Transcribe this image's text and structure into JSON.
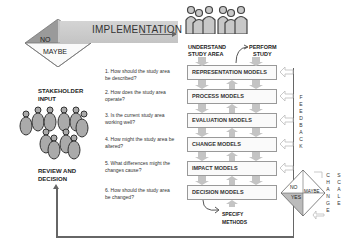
{
  "decision_diamond_left": {
    "no": "NO",
    "yes": "YES",
    "maybe": "MAYBE"
  },
  "implementation": {
    "label": "IMPLEMENTATION"
  },
  "stakeholder": {
    "label_line1": "STAKEHOLDER",
    "label_line2": "INPUT"
  },
  "review": {
    "label_line1": "REVIEW AND",
    "label_line2": "DECISION"
  },
  "questions": [
    {
      "num": "1.",
      "text": "How should the study area be described?"
    },
    {
      "num": "2.",
      "text": "How does the study area operate?"
    },
    {
      "num": "3.",
      "text": "Is the current study area working well?"
    },
    {
      "num": "4.",
      "text": "How might the study area be altered?"
    },
    {
      "num": "5.",
      "text": "What differences might the changes cause?"
    },
    {
      "num": "6.",
      "text": "How should the study area be changed?"
    }
  ],
  "top_labels": {
    "understand_line1": "UNDERSTAND",
    "understand_line2": "STUDY AREA",
    "perform_line1": "PERFORM",
    "perform_line2": "STUDY"
  },
  "models": [
    "REPRESENTATION MODELS",
    "PROCESS MODELS",
    "EVALUATION MODELS",
    "CHANGE MODELS",
    "IMPACT MODELS",
    "DECISION MODELS"
  ],
  "specify": {
    "line1": "SPECIFY",
    "line2": "METHODS"
  },
  "feedback": {
    "letters": [
      "F",
      "E",
      "E",
      "D",
      "B",
      "A",
      "C",
      "K"
    ]
  },
  "decision_diamond_right": {
    "no": "NO",
    "yes": "YES",
    "maybe": "MAYBE"
  },
  "change_scale": {
    "change": [
      "C",
      "H",
      "A",
      "N",
      "G",
      "E"
    ],
    "scale": [
      "S",
      "C",
      "A",
      "L",
      "E"
    ]
  }
}
